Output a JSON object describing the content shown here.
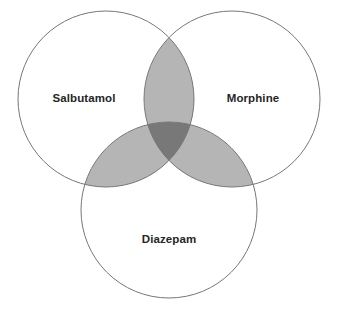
{
  "figure": {
    "type": "venn-diagram",
    "set_count": 3,
    "background_color": "#ffffff",
    "width": 338,
    "height": 314
  },
  "style": {
    "circle_stroke_color": "#777777",
    "circle_stroke_width": 1,
    "circle_fill": "none",
    "pair_overlap_fill": "#b5b5b5",
    "triple_overlap_fill": "#787878",
    "overlap_stroke_color": "#4a4a4a",
    "label_color": "#262626",
    "label_font_size": 11.5,
    "label_font_weight": "bold"
  },
  "sets": [
    {
      "id": "salbutamol",
      "label": "Salbutamol",
      "cx": 106,
      "cy": 99,
      "r": 88,
      "label_x": 84,
      "label_y": 99
    },
    {
      "id": "morphine",
      "label": "Morphine",
      "cx": 232,
      "cy": 99,
      "r": 88,
      "label_x": 253,
      "label_y": 99
    },
    {
      "id": "diazepam",
      "label": "Diazepam",
      "cx": 169,
      "cy": 210,
      "r": 88,
      "label_x": 169,
      "label_y": 240
    }
  ],
  "regions": [
    {
      "id": "salbutamol-only",
      "sets": [
        "salbutamol"
      ],
      "fill": "#ffffff"
    },
    {
      "id": "morphine-only",
      "sets": [
        "morphine"
      ],
      "fill": "#ffffff"
    },
    {
      "id": "diazepam-only",
      "sets": [
        "diazepam"
      ],
      "fill": "#ffffff"
    },
    {
      "id": "salbutamol-morphine",
      "sets": [
        "salbutamol",
        "morphine"
      ],
      "fill": "#b5b5b5"
    },
    {
      "id": "salbutamol-diazepam",
      "sets": [
        "salbutamol",
        "diazepam"
      ],
      "fill": "#b5b5b5"
    },
    {
      "id": "morphine-diazepam",
      "sets": [
        "morphine",
        "diazepam"
      ],
      "fill": "#b5b5b5"
    },
    {
      "id": "all-three",
      "sets": [
        "salbutamol",
        "morphine",
        "diazepam"
      ],
      "fill": "#787878"
    }
  ]
}
